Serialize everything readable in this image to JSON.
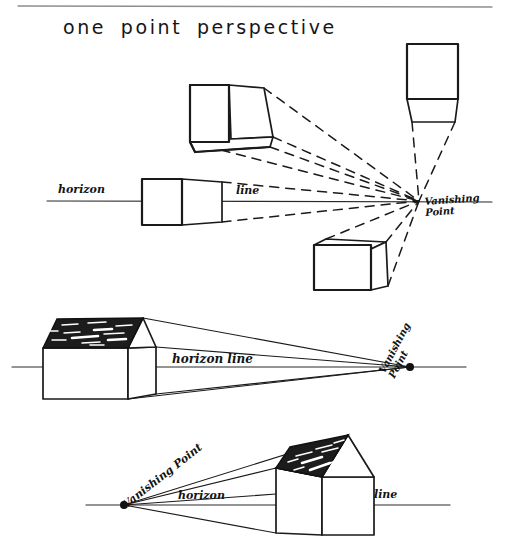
{
  "page": {
    "title": "one point perspective",
    "background_color": "#ffffff",
    "ink_color": "#1a1a1a",
    "width": 506,
    "height": 544
  },
  "diagrams": [
    {
      "id": "cubes-around-vanishing-point",
      "description": "Four boxes arranged around a single vanishing point on the horizon line, with dashed convergence lines",
      "horizon_label_left": "horizon",
      "horizon_label_right": "line",
      "vanishing_point_label_line1": "Vanishing",
      "vanishing_point_label_line2": "Point",
      "vanishing_point": {
        "x": 419,
        "y": 201
      },
      "horizon_y": 201,
      "boxes": [
        {
          "name": "box-above-left",
          "view": "from-below",
          "visible_faces": "front, right side, bottom"
        },
        {
          "name": "box-above-right",
          "view": "from-below-frontal",
          "visible_faces": "front, bottom"
        },
        {
          "name": "box-on-horizon",
          "view": "eye-level",
          "visible_faces": "front, right side"
        },
        {
          "name": "box-below-right",
          "view": "from-above",
          "visible_faces": "front, left side, top"
        }
      ]
    },
    {
      "id": "house-left-vp-right",
      "description": "Gabled house on the left, vanishing point on the right of the horizon line",
      "horizon_label": "horizon line",
      "vanishing_point_label_line1": "Vanishing",
      "vanishing_point_label_line2": "Point",
      "vanishing_point": {
        "x": 410,
        "y": 367
      },
      "horizon_y": 367,
      "roof_shading": "dark with white scratch highlights"
    },
    {
      "id": "house-right-vp-left",
      "description": "Vanishing point on the left of the horizon line, gabled house on the right",
      "vanishing_point_label": "Vanishing Point",
      "horizon_label_left": "horizon",
      "horizon_label_right": "line",
      "vanishing_point": {
        "x": 124,
        "y": 505
      },
      "horizon_y": 505,
      "roof_shading": "dark with white scratch highlights"
    }
  ],
  "decorations": {
    "top_rule": "thin gray horizontal rule across the top of the page"
  }
}
